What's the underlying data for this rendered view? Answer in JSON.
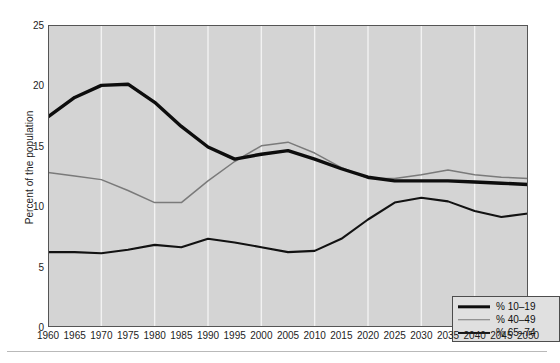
{
  "chart_data": {
    "type": "line",
    "title": "",
    "xlabel": "",
    "ylabel": "Percent of the population",
    "xlim": [
      1960,
      2050
    ],
    "ylim": [
      0,
      25
    ],
    "ytick_labels": [
      "0",
      "5",
      "10",
      "15",
      "20",
      "25"
    ],
    "ytick_values": [
      0,
      5,
      10,
      15,
      20,
      25
    ],
    "grid": "vertical white gridlines every 10 years",
    "legend_position": "bottom-right inside axes",
    "plot_background": "#d4d4d4",
    "x": [
      1960,
      1965,
      1970,
      1975,
      1980,
      1985,
      1990,
      1995,
      2000,
      2005,
      2010,
      2015,
      2020,
      2025,
      2030,
      2035,
      2040,
      2045,
      2050
    ],
    "xtick_labels": [
      "1960",
      "1965",
      "1970",
      "1975",
      "1980",
      "1985",
      "1990",
      "1995",
      "2000",
      "2005",
      "2010",
      "2015",
      "2020",
      "2025",
      "2030",
      "2035",
      "2040",
      "2045",
      "2050"
    ],
    "series": [
      {
        "name": "% 10–19",
        "color": "#0d0d0d",
        "width": 3.4,
        "values": [
          17.4,
          19.0,
          20.0,
          20.1,
          18.6,
          16.6,
          14.9,
          13.9,
          14.3,
          14.6,
          13.9,
          13.1,
          12.4,
          12.1,
          12.1,
          12.1,
          12.0,
          11.9,
          11.8
        ]
      },
      {
        "name": "% 40–49",
        "color": "#7a7a7a",
        "width": 1.5,
        "values": [
          12.8,
          12.5,
          12.2,
          11.3,
          10.3,
          10.3,
          12.1,
          13.7,
          15.0,
          15.3,
          14.4,
          13.2,
          12.3,
          12.3,
          12.6,
          13.0,
          12.6,
          12.4,
          12.3
        ]
      },
      {
        "name": "% 65–74",
        "color": "#121212",
        "width": 2.1,
        "values": [
          6.2,
          6.2,
          6.1,
          6.4,
          6.8,
          6.6,
          7.3,
          7.0,
          6.6,
          6.2,
          6.3,
          7.3,
          8.9,
          10.3,
          10.7,
          10.4,
          9.6,
          9.1,
          9.4
        ]
      }
    ]
  },
  "legend": {
    "items": [
      {
        "label": "% 10–19"
      },
      {
        "label": "% 40–49"
      },
      {
        "label": "% 65–74"
      }
    ]
  }
}
